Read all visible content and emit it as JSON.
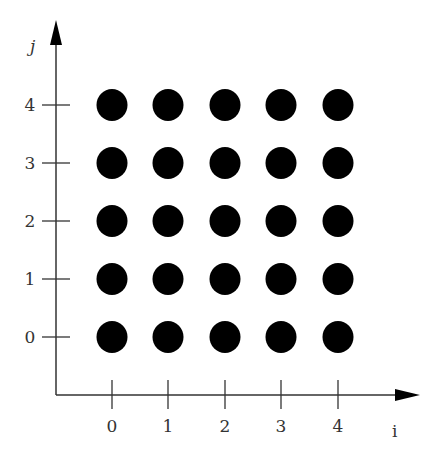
{
  "diagram": {
    "x_axis_label": "i",
    "y_axis_label": "j",
    "x_ticks": [
      "0",
      "1",
      "2",
      "3",
      "4"
    ],
    "y_ticks": [
      "0",
      "1",
      "2",
      "3",
      "4"
    ],
    "grid": {
      "rows": 5,
      "cols": 5,
      "point_color": "#000000"
    }
  },
  "chart_data": {
    "type": "scatter",
    "title": "",
    "xlabel": "i",
    "ylabel": "j",
    "x_ticks": [
      0,
      1,
      2,
      3,
      4
    ],
    "y_ticks": [
      0,
      1,
      2,
      3,
      4
    ],
    "points": [
      [
        0,
        0
      ],
      [
        1,
        0
      ],
      [
        2,
        0
      ],
      [
        3,
        0
      ],
      [
        4,
        0
      ],
      [
        0,
        1
      ],
      [
        1,
        1
      ],
      [
        2,
        1
      ],
      [
        3,
        1
      ],
      [
        4,
        1
      ],
      [
        0,
        2
      ],
      [
        1,
        2
      ],
      [
        2,
        2
      ],
      [
        3,
        2
      ],
      [
        4,
        2
      ],
      [
        0,
        3
      ],
      [
        1,
        3
      ],
      [
        2,
        3
      ],
      [
        3,
        3
      ],
      [
        4,
        3
      ],
      [
        0,
        4
      ],
      [
        1,
        4
      ],
      [
        2,
        4
      ],
      [
        3,
        4
      ],
      [
        4,
        4
      ]
    ],
    "grid": false
  }
}
